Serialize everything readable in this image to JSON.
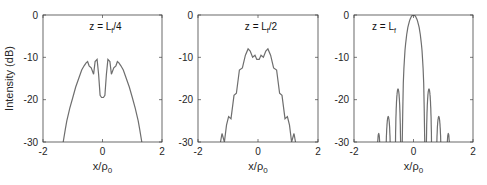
{
  "chart_data": [
    {
      "type": "line",
      "title": "z = L_f/4",
      "annotation": {
        "main": "z = L",
        "sub": "f",
        "suffix": "/4"
      },
      "xlabel": "x/ρ0",
      "ylabel": "Intensity (dB)",
      "xlim": [
        -2,
        2
      ],
      "ylim": [
        -30,
        0
      ],
      "xticks": [
        "-2",
        "0",
        "2"
      ],
      "yticks": [
        "0",
        "-10",
        "-20",
        "-30"
      ],
      "grid": false,
      "x": [
        -1.32,
        -1.25,
        -1.2,
        -1.1,
        -1.0,
        -0.9,
        -0.8,
        -0.7,
        -0.62,
        -0.55,
        -0.5,
        -0.45,
        -0.38,
        -0.3,
        -0.25,
        -0.18,
        -0.13,
        -0.08,
        -0.03,
        0.03,
        0.08,
        0.13,
        0.18,
        0.25,
        0.3,
        0.38,
        0.45,
        0.5,
        0.55,
        0.62,
        0.7,
        0.8,
        0.9,
        1.0,
        1.1,
        1.2,
        1.25,
        1.32
      ],
      "values": [
        -30,
        -27,
        -25,
        -22,
        -19.5,
        -17,
        -15,
        -13,
        -12,
        -11.3,
        -11,
        -12,
        -12.5,
        -14,
        -11,
        -10.5,
        -14,
        -19,
        -19.5,
        -19.5,
        -19,
        -14,
        -10.5,
        -11,
        -14,
        -12.5,
        -12,
        -11,
        -11.3,
        -12,
        -13,
        -15,
        -17,
        -19.5,
        -22,
        -25,
        -27,
        -30
      ]
    },
    {
      "type": "line",
      "title": "z = L_f/2",
      "annotation": {
        "main": "z = L",
        "sub": "f",
        "suffix": "/2"
      },
      "xlabel": "x/ρ0",
      "ylabel": "",
      "xlim": [
        -2,
        2
      ],
      "ylim": [
        -30,
        0
      ],
      "xticks": [
        "-2",
        "0",
        "2"
      ],
      "yticks": [
        "0",
        "-10",
        "-20",
        "-30"
      ],
      "grid": false,
      "x": [
        -1.25,
        -1.2,
        -1.12,
        -1.05,
        -0.98,
        -0.9,
        -0.8,
        -0.72,
        -0.62,
        -0.52,
        -0.42,
        -0.33,
        -0.26,
        -0.18,
        -0.1,
        -0.04,
        0.04,
        0.1,
        0.18,
        0.26,
        0.33,
        0.42,
        0.52,
        0.62,
        0.72,
        0.8,
        0.9,
        0.98,
        1.05,
        1.12,
        1.2,
        1.25
      ],
      "values": [
        -30,
        -28,
        -30,
        -26,
        -24,
        -24.5,
        -19,
        -18.5,
        -13,
        -12.5,
        -9.5,
        -8,
        -8.5,
        -10,
        -9.5,
        -10.5,
        -10.5,
        -9.5,
        -10,
        -8.5,
        -8,
        -9.5,
        -12.5,
        -13,
        -18.5,
        -19,
        -24.5,
        -24,
        -26,
        -30,
        -28,
        -30
      ]
    },
    {
      "type": "line",
      "title": "z = L_f",
      "annotation": {
        "main": "z = L",
        "sub": "f",
        "suffix": ""
      },
      "xlabel": "x/ρ0",
      "ylabel": "",
      "xlim": [
        -2,
        2
      ],
      "ylim": [
        -30,
        0
      ],
      "xticks": [
        "-2",
        "0",
        "2"
      ],
      "yticks": [
        "0",
        "-10",
        "-20",
        "-30"
      ],
      "grid": false,
      "main_lobe": {
        "center": 0,
        "peak_db": 0,
        "half_width": 0.38
      },
      "side_lobes": [
        {
          "center": -0.52,
          "peak_db": -17.5,
          "half_width": 0.1
        },
        {
          "center": 0.52,
          "peak_db": -17.5,
          "half_width": 0.1
        },
        {
          "center": -0.85,
          "peak_db": -24,
          "half_width": 0.1
        },
        {
          "center": 0.85,
          "peak_db": -24,
          "half_width": 0.1
        },
        {
          "center": -1.17,
          "peak_db": -28,
          "half_width": 0.08
        },
        {
          "center": 1.17,
          "peak_db": -28,
          "half_width": 0.08
        }
      ]
    }
  ],
  "panels": [
    {
      "id": "p1",
      "box": [
        43,
        15,
        162,
        142
      ]
    },
    {
      "id": "p2",
      "box": [
        198,
        15,
        318,
        142
      ]
    },
    {
      "id": "p3",
      "box": [
        354,
        15,
        473,
        142
      ]
    }
  ],
  "style": {
    "line_color": "#6e6e6e",
    "axis_color": "#444444"
  }
}
